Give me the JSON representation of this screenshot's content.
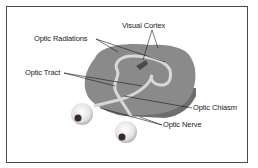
{
  "diagram": {
    "labels": {
      "visual_cortex": "Visual Cortex",
      "optic_radiations": "Optic Radiations",
      "optic_tract": "Optic Tract",
      "optic_chiasm": "Optic Chiasm",
      "optic_nerve": "Optic Nerve"
    },
    "colors": {
      "border": "#4a4a4a",
      "brain": "#8a8a8a",
      "brain_dark": "#6e6e6e",
      "pathway": "#d8d8d8",
      "eye": "#f2f2f2",
      "pupil": "#3a2a2a",
      "leader_line": "#1a1a1a"
    }
  }
}
